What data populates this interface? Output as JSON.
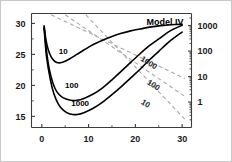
{
  "chart_data": {
    "type": "line",
    "title": "Model IV",
    "xlabel": "",
    "ylabel": "",
    "xlim": [
      -2.2,
      32
    ],
    "ylim": [
      13.2,
      31.6
    ],
    "xticks": [
      0,
      10,
      20,
      30
    ],
    "xtick_labels": [
      "0",
      "10",
      "20",
      "30"
    ],
    "yticks": [
      15,
      20,
      25,
      30
    ],
    "ytick_labels": [
      "15",
      "20",
      "25",
      "30"
    ],
    "grid": false,
    "legend": "none",
    "right_axis": {
      "scale": "log",
      "lim": [
        0.1,
        3000
      ],
      "ticks": [
        1000,
        100,
        10,
        1
      ],
      "tick_labels": [
        "1000",
        "100",
        "10",
        "1"
      ]
    },
    "series": [
      {
        "name": "10",
        "label": "10",
        "label_x": 4.6,
        "label_y": 25.0,
        "style": "solid",
        "color": "#000000",
        "x": [
          0.5,
          0.9,
          1.4,
          2.0,
          2.6,
          3.2,
          4.0,
          5.0,
          6.0,
          7.5,
          9.0,
          11.0,
          13.0,
          15.0,
          17.0,
          19.0,
          21.0,
          23.0,
          25.0,
          27.0,
          28.5,
          30.0
        ],
        "y": [
          29.6,
          27.3,
          25.7,
          24.6,
          24.0,
          23.7,
          23.65,
          23.9,
          24.3,
          25.0,
          25.7,
          26.6,
          27.3,
          27.9,
          28.4,
          28.8,
          29.1,
          29.4,
          29.6,
          29.75,
          29.82,
          29.85
        ]
      },
      {
        "name": "100",
        "label": "100",
        "label_x": 6.4,
        "label_y": 19.6,
        "style": "solid",
        "color": "#000000",
        "x": [
          0.5,
          1.0,
          1.6,
          2.4,
          3.2,
          4.2,
          5.2,
          6.2,
          7.5,
          9.0,
          11.0,
          13.0,
          15.0,
          17.0,
          19.0,
          21.0,
          23.0,
          25.0,
          27.0,
          28.5,
          30.0
        ],
        "y": [
          29.4,
          25.6,
          22.6,
          20.3,
          19.0,
          18.2,
          17.8,
          17.6,
          17.6,
          17.9,
          18.6,
          19.6,
          20.9,
          22.3,
          23.7,
          25.1,
          26.4,
          27.5,
          28.6,
          29.2,
          29.7
        ]
      },
      {
        "name": "1000",
        "label": "1000",
        "label_x": 8.2,
        "label_y": 16.6,
        "style": "solid",
        "color": "#000000",
        "x": [
          0.5,
          1.0,
          1.8,
          2.6,
          3.6,
          4.6,
          5.6,
          6.6,
          7.6,
          9.0,
          11.0,
          13.0,
          15.0,
          17.0,
          19.0,
          21.0,
          23.0,
          25.0,
          27.0,
          28.5,
          30.0
        ],
        "y": [
          29.2,
          24.7,
          21.0,
          18.6,
          16.9,
          16.0,
          15.5,
          15.3,
          15.3,
          15.6,
          16.3,
          17.3,
          18.5,
          19.8,
          21.2,
          22.6,
          24.1,
          25.5,
          26.9,
          27.8,
          28.6
        ]
      }
    ],
    "guide_lines": [
      {
        "name": "guide-1000",
        "label": "1000",
        "label_x": 22.6,
        "label_y": 23.3,
        "label_rotation": 32,
        "style": "dashed",
        "color": "#a8a8a8",
        "x": [
          2.0,
          30.6
        ],
        "y": [
          31.4,
          21.1
        ]
      },
      {
        "name": "guide-100",
        "label": "100",
        "label_x": 23.6,
        "label_y": 19.7,
        "label_rotation": 32,
        "style": "dashed",
        "color": "#a8a8a8",
        "x": [
          5.0,
          31.0
        ],
        "y": [
          31.4,
          18.0
        ]
      },
      {
        "name": "guide-10",
        "label": "10",
        "label_x": 21.9,
        "label_y": 16.7,
        "label_rotation": 32,
        "style": "dashed",
        "color": "#a8a8a8",
        "x": [
          9.4,
          31.0
        ],
        "y": [
          31.4,
          14.2
        ]
      }
    ]
  }
}
